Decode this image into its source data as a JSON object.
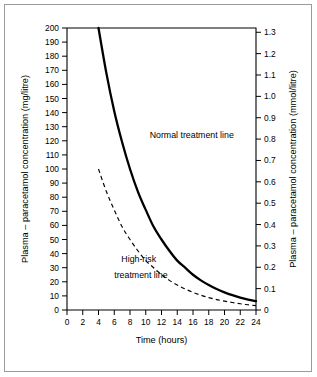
{
  "figure": {
    "background_color": "#ffffff",
    "frame_color": "#9b9b9b",
    "line_color": "#000000"
  },
  "chart_data": {
    "type": "line",
    "title": "",
    "xlabel": "Time (hours)",
    "ylabel": "Plasma – paracetamol concentration (mg/litre)",
    "ylabel_right": "Plasma – paracetamol concentration (mmol/litre)",
    "xlim": [
      0,
      24
    ],
    "ylim": [
      0,
      200
    ],
    "ylim_right": [
      0,
      1.32
    ],
    "grid": false,
    "legend_position": "inline-annotation",
    "xticks": [
      0,
      2,
      4,
      6,
      8,
      10,
      12,
      14,
      16,
      18,
      20,
      22,
      24
    ],
    "xticklabels": [
      "0",
      "2",
      "4",
      "6",
      "8",
      "10",
      "12",
      "14",
      "16",
      "18",
      "20",
      "22",
      "24"
    ],
    "yticks": [
      0,
      10,
      20,
      30,
      40,
      50,
      60,
      70,
      80,
      90,
      100,
      110,
      120,
      130,
      140,
      150,
      160,
      170,
      180,
      190,
      200
    ],
    "yticklabels": [
      "0",
      "10",
      "20",
      "30",
      "40",
      "50",
      "60",
      "70",
      "80",
      "90",
      "100",
      "110",
      "120",
      "130",
      "140",
      "150",
      "160",
      "170",
      "180",
      "190",
      "200"
    ],
    "yticks_right": [
      0,
      0.1,
      0.2,
      0.3,
      0.4,
      0.5,
      0.6,
      0.7,
      0.8,
      0.9,
      1.0,
      1.1,
      1.2,
      1.3
    ],
    "yticklabels_right": [
      "0",
      "0.1",
      "0.2",
      "0.3",
      "0.4",
      "0.5",
      "0.6",
      "0.7",
      "0.8",
      "0.9",
      "1.0",
      "1.1",
      "1.2",
      "1.3"
    ],
    "series": [
      {
        "name": "Normal treatment line",
        "style": "solid",
        "x": [
          4,
          5,
          6,
          7,
          8,
          9,
          10,
          11,
          12,
          13,
          14,
          15,
          16,
          17,
          18,
          19,
          20,
          21,
          22,
          23,
          24
        ],
        "values": [
          200,
          168,
          141,
          119,
          100,
          84,
          71,
          59,
          50,
          42,
          35,
          30,
          25,
          21,
          17.7,
          14.9,
          12.5,
          10.5,
          8.8,
          7.4,
          6.3
        ]
      },
      {
        "name": "High-risk treatment line",
        "style": "dashed",
        "x": [
          4,
          5,
          6,
          7,
          8,
          9,
          10,
          11,
          12,
          13,
          14,
          15,
          16,
          17,
          18,
          19,
          20,
          21,
          22,
          23,
          24
        ],
        "values": [
          100,
          84,
          71,
          59,
          50,
          42,
          35,
          30,
          25,
          21,
          17.7,
          14.9,
          12.5,
          10.5,
          8.8,
          7.4,
          6.3,
          5.3,
          4.4,
          3.7,
          3.1
        ]
      }
    ],
    "annotations": [
      {
        "text": "Normal treatment line",
        "x": 10.5,
        "y": 122
      },
      {
        "text": "High-risk",
        "x": 6.9,
        "y": 34
      },
      {
        "text": "treatment line",
        "x": 6.0,
        "y": 23
      }
    ]
  }
}
